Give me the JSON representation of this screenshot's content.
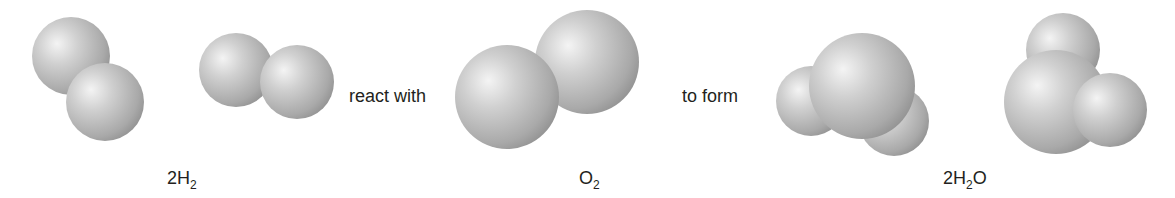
{
  "diagram": {
    "type": "chemical-reaction-space-filling-model",
    "equation": "2H2 + O2 -> 2H2O",
    "connectors": {
      "react_with": "react with",
      "to_form": "to form"
    },
    "groups": [
      {
        "id": "reactant-hydrogen",
        "formula_parts": {
          "coef": "2",
          "sym": "H",
          "sub": "2",
          "tail": ""
        },
        "molecules": [
          {
            "name": "hydrogen-molecule-1",
            "atoms": [
              {
                "element": "H",
                "cx": 71,
                "cy": 56,
                "r": 39
              },
              {
                "element": "H",
                "cx": 105,
                "cy": 102,
                "r": 39
              }
            ]
          },
          {
            "name": "hydrogen-molecule-2",
            "atoms": [
              {
                "element": "H",
                "cx": 236,
                "cy": 70,
                "r": 37
              },
              {
                "element": "H",
                "cx": 297,
                "cy": 82,
                "r": 37
              }
            ]
          }
        ]
      },
      {
        "id": "reactant-oxygen",
        "formula_parts": {
          "coef": "",
          "sym": "O",
          "sub": "2",
          "tail": ""
        },
        "molecules": [
          {
            "name": "oxygen-molecule",
            "atoms": [
              {
                "element": "O",
                "cx": 587,
                "cy": 62,
                "r": 52
              },
              {
                "element": "O",
                "cx": 507,
                "cy": 97,
                "r": 52
              }
            ]
          }
        ]
      },
      {
        "id": "product-water",
        "formula_parts": {
          "coef": "2",
          "sym": "H",
          "sub": "2",
          "tail": "O"
        },
        "molecules": [
          {
            "name": "water-molecule-1",
            "atoms": [
              {
                "element": "H",
                "cx": 811,
                "cy": 101,
                "r": 35
              },
              {
                "element": "H",
                "cx": 894,
                "cy": 121,
                "r": 35
              },
              {
                "element": "O",
                "cx": 862,
                "cy": 86,
                "r": 53
              }
            ]
          },
          {
            "name": "water-molecule-2",
            "atoms": [
              {
                "element": "H",
                "cx": 1063,
                "cy": 50,
                "r": 37
              },
              {
                "element": "O",
                "cx": 1056,
                "cy": 102,
                "r": 52
              },
              {
                "element": "H",
                "cx": 1110,
                "cy": 110,
                "r": 37
              }
            ]
          }
        ]
      }
    ],
    "colors": {
      "sphere_highlight": "#f4f4f4",
      "sphere_mid": "#c4c4c4",
      "sphere_edge": "#8e8e8e",
      "text": "#231f20"
    }
  }
}
